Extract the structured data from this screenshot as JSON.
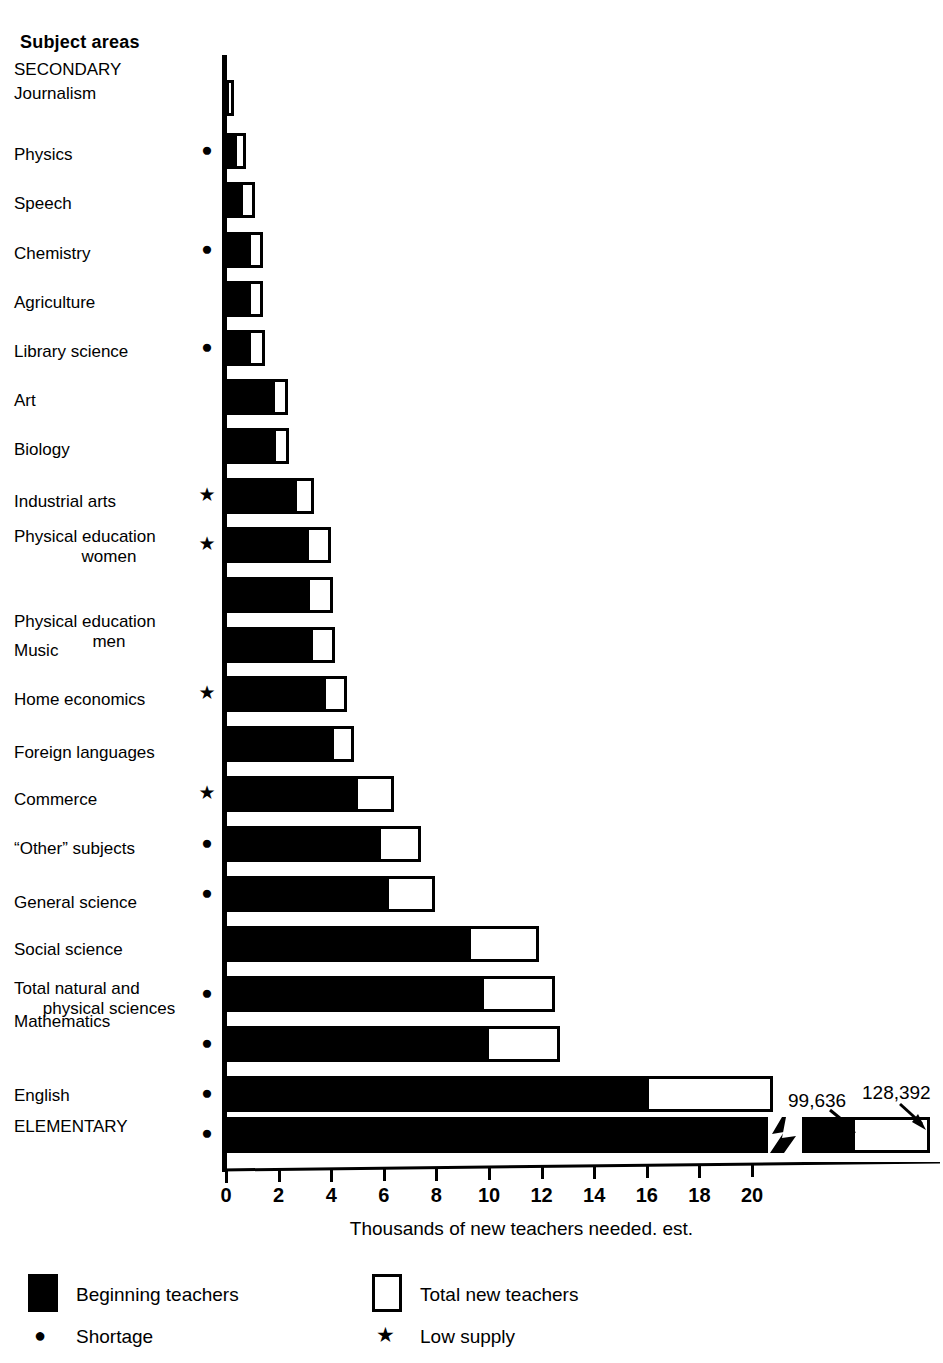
{
  "header": {
    "subject_areas_label": "Subject areas"
  },
  "axis": {
    "x_title": "Thousands of new teachers needed. est.",
    "tick_labels": [
      "0",
      "2",
      "4",
      "6",
      "8",
      "10",
      "12",
      "14",
      "16",
      "18",
      "20"
    ],
    "tick_values": [
      0,
      2,
      4,
      6,
      8,
      10,
      12,
      14,
      16,
      18,
      20
    ]
  },
  "legend": {
    "beginning_label": "Beginning teachers",
    "total_label": "Total new teachers",
    "shortage_label": "Shortage",
    "low_supply_label": "Low supply",
    "shortage_glyph": "●",
    "low_supply_glyph": "★"
  },
  "elementary_callouts": {
    "beginning_value_label": "99,636",
    "total_value_label": "128,392"
  },
  "colors": {
    "ink": "#000000",
    "paper": "#ffffff"
  },
  "chart_data": {
    "type": "bar",
    "orientation": "horizontal",
    "title": "",
    "xlabel": "Thousands of new teachers needed. est.",
    "ylabel": "Subject areas",
    "xlim": [
      0,
      21.5
    ],
    "grid": false,
    "legend_position": "bottom",
    "series": [
      {
        "name": "Beginning teachers",
        "style": "solid-black"
      },
      {
        "name": "Total new teachers",
        "style": "open-outline"
      }
    ],
    "group_headings": [
      "SECONDARY",
      "ELEMENTARY"
    ],
    "categories": [
      "SECONDARY",
      "Journalism",
      "Physics",
      "Speech",
      "Chemistry",
      "Agriculture",
      "Library science",
      "Art",
      "Biology",
      "Industrial arts",
      "Physical education\nwomen",
      "Physical education\nmen",
      "Music",
      "Home economics",
      "Foreign languages",
      "Commerce",
      "“Other” subjects",
      "General science",
      "Social science",
      "Total natural and\nphysical sciences",
      "Mathematics",
      "English",
      "ELEMENTARY"
    ],
    "rows": [
      {
        "label": "SECONDARY",
        "heading": true,
        "beginning": null,
        "total": null,
        "marker": ""
      },
      {
        "label": "Journalism",
        "heading": false,
        "beginning": 0.05,
        "total": 0.3,
        "marker": ""
      },
      {
        "label": "Physics",
        "heading": false,
        "beginning": 0.4,
        "total": 0.75,
        "marker": "shortage"
      },
      {
        "label": "Speech",
        "heading": false,
        "beginning": 0.65,
        "total": 1.1,
        "marker": ""
      },
      {
        "label": "Chemistry",
        "heading": false,
        "beginning": 0.95,
        "total": 1.4,
        "marker": "shortage"
      },
      {
        "label": "Agriculture",
        "heading": false,
        "beginning": 0.95,
        "total": 1.4,
        "marker": ""
      },
      {
        "label": "Library science",
        "heading": false,
        "beginning": 0.95,
        "total": 1.5,
        "marker": "shortage"
      },
      {
        "label": "Art",
        "heading": false,
        "beginning": 1.85,
        "total": 2.35,
        "marker": ""
      },
      {
        "label": "Biology",
        "heading": false,
        "beginning": 1.9,
        "total": 2.4,
        "marker": ""
      },
      {
        "label": "Industrial arts",
        "heading": false,
        "beginning": 2.7,
        "total": 3.35,
        "marker": "low-supply"
      },
      {
        "label": "Physical education\nwomen",
        "heading": false,
        "beginning": 3.15,
        "total": 4.0,
        "marker": "low-supply"
      },
      {
        "label": "Physical education\nmen",
        "heading": false,
        "beginning": 3.2,
        "total": 4.05,
        "marker": ""
      },
      {
        "label": "Music",
        "heading": false,
        "beginning": 3.3,
        "total": 4.15,
        "marker": ""
      },
      {
        "label": "Home economics",
        "heading": false,
        "beginning": 3.8,
        "total": 4.6,
        "marker": "low-supply"
      },
      {
        "label": "Foreign languages",
        "heading": false,
        "beginning": 4.1,
        "total": 4.85,
        "marker": ""
      },
      {
        "label": "Commerce",
        "heading": false,
        "beginning": 5.0,
        "total": 6.4,
        "marker": "low-supply"
      },
      {
        "label": "“Other” subjects",
        "heading": false,
        "beginning": 5.9,
        "total": 7.4,
        "marker": "shortage"
      },
      {
        "label": "General science",
        "heading": false,
        "beginning": 6.2,
        "total": 7.95,
        "marker": "shortage"
      },
      {
        "label": "Social science",
        "heading": false,
        "beginning": 9.3,
        "total": 11.9,
        "marker": ""
      },
      {
        "label": "Total natural and\nphysical sciences",
        "heading": false,
        "beginning": 9.8,
        "total": 12.5,
        "marker": "shortage"
      },
      {
        "label": "Mathematics",
        "heading": false,
        "beginning": 10.0,
        "total": 12.7,
        "marker": "shortage"
      },
      {
        "label": "English",
        "heading": false,
        "beginning": 16.1,
        "total": 20.8,
        "marker": "shortage"
      },
      {
        "label": "ELEMENTARY",
        "heading": true,
        "beginning": 99.636,
        "total": 128.392,
        "marker": "shortage",
        "axis_break": true
      }
    ]
  }
}
